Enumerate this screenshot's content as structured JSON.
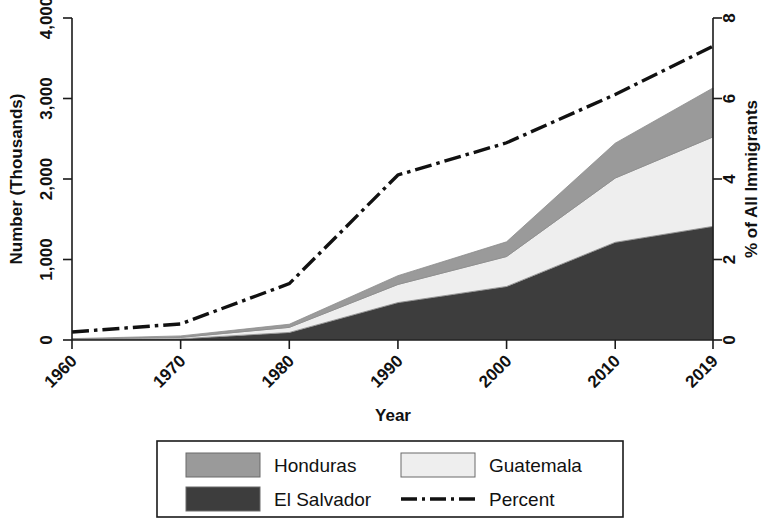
{
  "chart_data": {
    "type": "area",
    "title": "",
    "subtitle": "",
    "xlabel": "Year",
    "ylabel": "Number (Thousands)",
    "y2label": "% of All Immigrants",
    "x": [
      1960,
      1970,
      1980,
      1990,
      2000,
      2010,
      2019
    ],
    "xtick_labels": [
      "1960",
      "1970",
      "1980",
      "1990",
      "2000",
      "2010",
      "2019"
    ],
    "xlim": [
      1960,
      2019
    ],
    "ylim": [
      0,
      4000
    ],
    "ytick_labels": [
      "0",
      "1,000",
      "2,000",
      "3,000",
      "4,000"
    ],
    "ytick_values": [
      0,
      1000,
      2000,
      3000,
      4000
    ],
    "y2lim": [
      0,
      8
    ],
    "y2tick_labels": [
      "0",
      "2",
      "4",
      "6",
      "8"
    ],
    "y2tick_values": [
      0,
      2,
      4,
      6,
      8
    ],
    "grid": false,
    "stacked": true,
    "stack_order_bottom_to_top": [
      "El Salvador",
      "Guatemala",
      "Honduras"
    ],
    "series": [
      {
        "name": "El Salvador",
        "kind": "area",
        "color": "#3d3d3d",
        "unit": "thousands",
        "axis": "left",
        "values": [
          6,
          15,
          94,
          465,
          665,
          1214,
          1412
        ]
      },
      {
        "name": "Guatemala",
        "kind": "area",
        "color": "#eeeeee",
        "unit": "thousands",
        "axis": "left",
        "values": [
          5,
          17,
          63,
          225,
          372,
          798,
          1111
        ]
      },
      {
        "name": "Honduras",
        "kind": "area",
        "color": "#9a9a9a",
        "unit": "thousands",
        "axis": "left",
        "values": [
          6,
          19,
          39,
          109,
          183,
          433,
          608
        ]
      },
      {
        "name": "Percent",
        "kind": "line",
        "color": "#111111",
        "style": "dash-dot",
        "unit": "percent",
        "axis": "right",
        "values": [
          0.2,
          0.4,
          1.4,
          4.1,
          4.9,
          6.1,
          7.3
        ]
      }
    ],
    "legend": {
      "position": "bottom",
      "entries": [
        {
          "label": "Honduras",
          "marker": "swatch",
          "color": "#9a9a9a"
        },
        {
          "label": "Guatemala",
          "marker": "swatch",
          "color": "#eeeeee"
        },
        {
          "label": "El Salvador",
          "marker": "swatch",
          "color": "#3d3d3d"
        },
        {
          "label": "Percent",
          "marker": "dash-dot-line",
          "color": "#111111"
        }
      ]
    }
  },
  "axes": {
    "left_title": "Number (Thousands)",
    "right_title": "% of All Immigrants",
    "bottom_title": "Year"
  },
  "legend_labels": {
    "honduras": "Honduras",
    "guatemala": "Guatemala",
    "el_salvador": "El Salvador",
    "percent": "Percent"
  },
  "ticks": {
    "y_left": [
      "4,000",
      "3,000",
      "2,000",
      "1,000",
      "0"
    ],
    "y_right": [
      "8",
      "6",
      "4",
      "2",
      "0"
    ],
    "x": [
      "1960",
      "1970",
      "1980",
      "1990",
      "2000",
      "2010",
      "2019"
    ]
  }
}
